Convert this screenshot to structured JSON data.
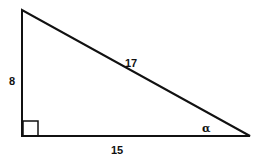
{
  "diagram": {
    "type": "right-triangle",
    "vertices": {
      "top_left": [
        22,
        10
      ],
      "bottom_left": [
        22,
        136
      ],
      "bottom_right": [
        250,
        136
      ]
    },
    "right_angle_marker": {
      "x": 23,
      "y": 121,
      "size": 15
    },
    "labels": {
      "vertical_leg": "8",
      "hypotenuse": "17",
      "horizontal_leg": "15",
      "angle": "α"
    },
    "stroke_color": "#111111",
    "background": "#ffffff"
  }
}
